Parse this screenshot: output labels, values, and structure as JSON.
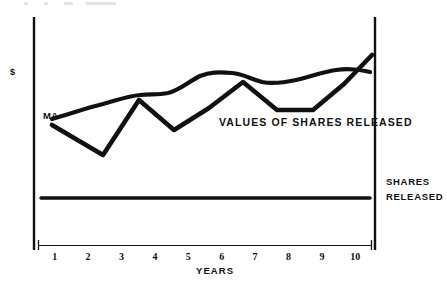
{
  "chart_data": {
    "type": "line",
    "title": "",
    "xlabel": "YEARS",
    "ylabel": "$",
    "grid": false,
    "legend_position": "inline-right",
    "x": [
      1,
      2,
      3,
      4,
      5,
      6,
      7,
      8,
      9,
      10
    ],
    "xlim": [
      0.5,
      10.5
    ],
    "ylim": [
      0,
      100
    ],
    "tick_labels": [
      "1",
      "2",
      "3",
      "4",
      "5",
      "6",
      "7",
      "8",
      "9",
      "10"
    ],
    "annotations": [
      {
        "name": "series-annotation",
        "text": "VALUES OF SHARES RELEASED"
      },
      {
        "name": "origin-label",
        "text": "MA"
      },
      {
        "name": "baseline-legend-line1",
        "text": "SHARES"
      },
      {
        "name": "baseline-legend-line2",
        "text": "RELEASED"
      }
    ],
    "series": [
      {
        "name": "values-of-shares-trend",
        "label": "VALUES OF SHARES RELEASED",
        "style": "smooth-rising",
        "color": "#111111",
        "values": [
          38,
          47,
          57,
          59,
          66,
          65,
          64,
          66,
          70,
          68
        ]
      },
      {
        "name": "share-price-volatile",
        "label": "",
        "style": "jagged-volatile",
        "color": "#111111",
        "values": [
          35,
          23,
          57,
          41,
          54,
          63,
          51,
          51,
          66,
          78
        ]
      },
      {
        "name": "shares-released-baseline",
        "label": "SHARES RELEASED",
        "style": "flat-baseline",
        "color": "#111111",
        "values": [
          14,
          14,
          14,
          14,
          14,
          14,
          14,
          14,
          14,
          14
        ]
      }
    ]
  },
  "axes": {
    "y_label": "$",
    "x_title": "YEARS"
  },
  "legend": {
    "baseline_line1": "SHARES",
    "baseline_line2": "RELEASED",
    "inline_note": "VALUES OF SHARES RELEASED",
    "origin_marker": "MA"
  },
  "colors": {
    "ink": "#111111",
    "background": "#ffffff"
  }
}
